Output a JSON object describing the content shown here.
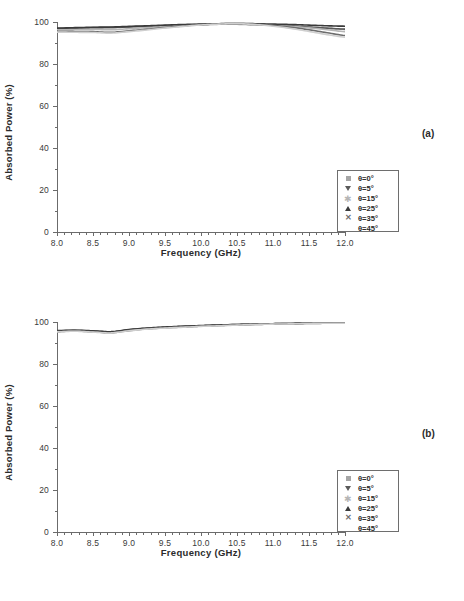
{
  "figure": {
    "panels": [
      {
        "tag": "(a)",
        "xlabel": "Frequency (GHz)",
        "ylabel": "Absorbed Power (%)"
      },
      {
        "tag": "(b)",
        "xlabel": "Frequency (GHz)",
        "ylabel": "Absorbed Power (%)"
      }
    ],
    "legend": {
      "entries": [
        {
          "label": "θ=0°",
          "marker": "square-marker"
        },
        {
          "label": "θ=5°",
          "marker": "down-triangle-marker"
        },
        {
          "label": "θ=15°",
          "marker": "star-marker"
        },
        {
          "label": "θ=25°",
          "marker": "up-triangle-marker"
        },
        {
          "label": "θ=35°",
          "marker": "cross-x-marker"
        },
        {
          "label": "θ=45°",
          "marker": "no-marker"
        }
      ]
    },
    "yticks": [
      "0",
      "20",
      "40",
      "60",
      "80",
      "100"
    ],
    "xticks": [
      "8.0",
      "8.5",
      "9.0",
      "9.5",
      "10.0",
      "10.5",
      "11.0",
      "11.5",
      "12.0"
    ]
  },
  "chart_data": [
    {
      "type": "line",
      "panel": "(a)",
      "title": "",
      "xlabel": "Frequency (GHz)",
      "ylabel": "Absorbed Power (%)",
      "xlim": [
        8.0,
        12.0
      ],
      "ylim": [
        0,
        100
      ],
      "xticks": [
        8.0,
        8.5,
        9.0,
        9.5,
        10.0,
        10.5,
        11.0,
        11.5,
        12.0
      ],
      "yticks": [
        0,
        20,
        40,
        60,
        80,
        100
      ],
      "grid": false,
      "legend_position": "lower-right",
      "x": [
        8.0,
        8.25,
        8.5,
        8.75,
        9.0,
        9.25,
        9.5,
        9.75,
        10.0,
        10.25,
        10.5,
        10.75,
        11.0,
        11.25,
        11.5,
        11.75,
        12.0
      ],
      "series": [
        {
          "name": "θ=0°",
          "color": "#a6a6a6",
          "values": [
            96.8,
            97.0,
            97.2,
            97.3,
            97.6,
            97.9,
            98.2,
            98.5,
            98.7,
            98.9,
            98.9,
            98.7,
            98.4,
            98.0,
            97.5,
            97.0,
            96.5
          ]
        },
        {
          "name": "θ=5°",
          "color": "#5a5a5a",
          "values": [
            96.9,
            97.1,
            97.3,
            97.4,
            97.7,
            98.0,
            98.3,
            98.6,
            98.8,
            99.0,
            99.0,
            98.8,
            98.5,
            98.1,
            97.6,
            97.1,
            96.6
          ]
        },
        {
          "name": "θ=15°",
          "color": "#b5b5b5",
          "values": [
            96.3,
            96.4,
            96.5,
            96.3,
            96.8,
            97.4,
            97.9,
            98.4,
            98.8,
            99.1,
            99.2,
            99.0,
            98.6,
            98.0,
            97.2,
            96.3,
            95.4
          ]
        },
        {
          "name": "θ=25°",
          "color": "#3a3a3a",
          "values": [
            97.1,
            97.3,
            97.5,
            97.6,
            97.9,
            98.2,
            98.5,
            98.8,
            99.0,
            99.2,
            99.3,
            99.2,
            99.0,
            98.8,
            98.5,
            98.2,
            98.0
          ]
        },
        {
          "name": "θ=35°",
          "color": "#6d6d6d",
          "values": [
            95.6,
            95.5,
            95.4,
            95.1,
            95.8,
            96.6,
            97.4,
            98.1,
            98.7,
            99.1,
            99.3,
            99.0,
            98.4,
            97.5,
            96.3,
            94.9,
            93.6
          ]
        },
        {
          "name": "θ=45°",
          "color": "#cfcfcf",
          "values": [
            95.2,
            95.1,
            95.0,
            94.7,
            95.4,
            96.2,
            97.1,
            97.9,
            98.6,
            99.0,
            99.2,
            98.8,
            98.0,
            96.9,
            95.5,
            94.0,
            92.8
          ]
        }
      ]
    },
    {
      "type": "line",
      "panel": "(b)",
      "title": "",
      "xlabel": "Frequency (GHz)",
      "ylabel": "Absorbed Power (%)",
      "xlim": [
        8.0,
        12.0
      ],
      "ylim": [
        0,
        100
      ],
      "xticks": [
        8.0,
        8.5,
        9.0,
        9.5,
        10.0,
        10.5,
        11.0,
        11.5,
        12.0
      ],
      "yticks": [
        0,
        20,
        40,
        60,
        80,
        100
      ],
      "grid": false,
      "legend_position": "lower-right",
      "x": [
        8.0,
        8.25,
        8.5,
        8.75,
        9.0,
        9.25,
        9.5,
        9.75,
        10.0,
        10.25,
        10.5,
        10.75,
        11.0,
        11.25,
        11.5,
        11.75,
        12.0
      ],
      "series": [
        {
          "name": "θ=0°",
          "color": "#a6a6a6",
          "values": [
            95.7,
            95.9,
            95.6,
            95.2,
            96.2,
            96.9,
            97.4,
            97.8,
            98.1,
            98.4,
            98.7,
            98.9,
            99.1,
            99.3,
            99.4,
            99.5,
            99.5
          ]
        },
        {
          "name": "θ=5°",
          "color": "#5a5a5a",
          "values": [
            95.8,
            96.0,
            95.7,
            95.3,
            96.3,
            97.0,
            97.5,
            97.9,
            98.2,
            98.5,
            98.8,
            99.0,
            99.2,
            99.3,
            99.4,
            99.5,
            99.5
          ]
        },
        {
          "name": "θ=15°",
          "color": "#b5b5b5",
          "values": [
            95.5,
            95.8,
            95.4,
            95.0,
            96.0,
            96.8,
            97.3,
            97.7,
            98.0,
            98.3,
            98.6,
            98.9,
            99.1,
            99.2,
            99.4,
            99.5,
            99.5
          ]
        },
        {
          "name": "θ=25°",
          "color": "#3a3a3a",
          "values": [
            95.9,
            96.1,
            95.8,
            95.4,
            96.4,
            97.1,
            97.6,
            98.0,
            98.3,
            98.6,
            98.8,
            99.0,
            99.2,
            99.3,
            99.4,
            99.5,
            99.5
          ]
        },
        {
          "name": "θ=35°",
          "color": "#6d6d6d",
          "values": [
            95.4,
            95.7,
            95.3,
            94.9,
            95.9,
            96.7,
            97.2,
            97.6,
            98.0,
            98.3,
            98.6,
            98.8,
            99.0,
            99.2,
            99.3,
            99.4,
            99.5
          ]
        },
        {
          "name": "θ=45°",
          "color": "#cfcfcf",
          "values": [
            95.3,
            95.6,
            95.2,
            94.8,
            95.8,
            96.6,
            97.1,
            97.5,
            97.9,
            98.2,
            98.5,
            98.8,
            99.0,
            99.1,
            99.3,
            99.4,
            99.4
          ]
        }
      ]
    }
  ]
}
